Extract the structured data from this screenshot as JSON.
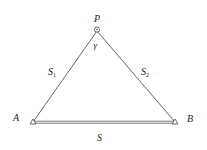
{
  "diagram": {
    "type": "triangle",
    "points": {
      "P": {
        "label": "P",
        "x": 97,
        "y": 30
      },
      "A": {
        "label": "A",
        "x": 33,
        "y": 122
      },
      "B": {
        "label": "B",
        "x": 175,
        "y": 122
      }
    },
    "labels": {
      "P": "P",
      "A": "A",
      "B": "B",
      "angle": "γ",
      "side_AP": "S",
      "side_AP_sub": "1",
      "side_BP": "S",
      "side_BP_sub": "2",
      "side_AB": "S"
    },
    "colors": {
      "line": "#444444",
      "text": "#222222"
    }
  }
}
